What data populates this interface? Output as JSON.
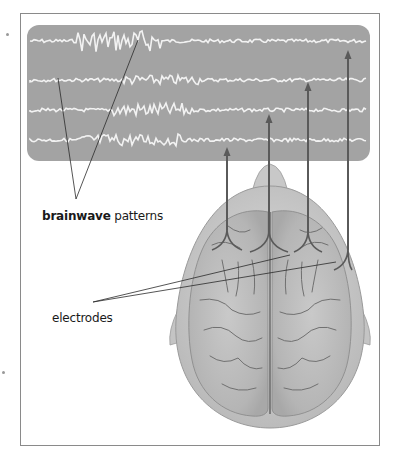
{
  "figure": {
    "type": "EEG brainwave recording illustration",
    "labels": {
      "brainwave_bold": "brainwave",
      "brainwave_rest": " patterns",
      "electrodes": "electrodes"
    },
    "eeg_panel": {
      "trace_count": 4,
      "background_color": "#a3a3a3",
      "trace_color": "#f2f2f2"
    },
    "electrodes": {
      "count": 4,
      "lead_color": "#5a5a5a"
    },
    "colors": {
      "frame": "#8a8a8a",
      "head": "#cfcfcf",
      "brain": "#bdbdbd",
      "sulci": "#6f6f6f"
    }
  }
}
